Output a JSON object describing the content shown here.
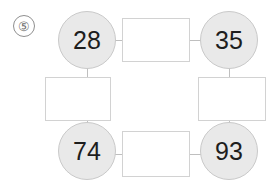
{
  "page": {
    "problem_marker": "⑤",
    "background_color": "#ffffff"
  },
  "palette": {
    "node_fill": "#e9e9e9",
    "node_border": "#c9c9c9",
    "node_text": "#1d1d1d",
    "box_fill": "#ffffff",
    "box_border": "#d2d2d2",
    "connector": "#bfbfbf",
    "marker_text": "#6d6d6d",
    "marker_border": "#8f8f8f"
  },
  "diagram": {
    "nodes": [
      {
        "position": "top-left",
        "value": "28"
      },
      {
        "position": "top-right",
        "value": "35"
      },
      {
        "position": "bottom-left",
        "value": "74"
      },
      {
        "position": "bottom-right",
        "value": "93"
      }
    ],
    "answer_boxes": [
      {
        "position": "top",
        "value": ""
      },
      {
        "position": "left",
        "value": ""
      },
      {
        "position": "right",
        "value": ""
      },
      {
        "position": "bottom",
        "value": ""
      }
    ]
  }
}
